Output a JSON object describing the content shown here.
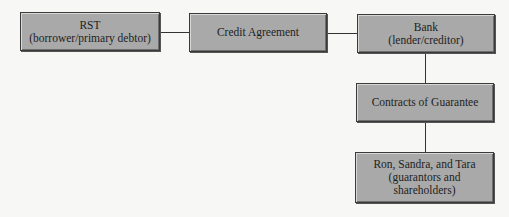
{
  "diagram": {
    "nodes": [
      {
        "id": "rst",
        "label": "RST\n(borrower/primary debtor)"
      },
      {
        "id": "credit",
        "label": "Credit Agreement"
      },
      {
        "id": "bank",
        "label": "Bank\n(lender/creditor)"
      },
      {
        "id": "contracts",
        "label": "Contracts of Guarantee"
      },
      {
        "id": "guarantors",
        "label": "Ron, Sandra, and Tara\n(guarantors and\nshareholders)"
      }
    ],
    "edges": [
      {
        "from": "rst",
        "to": "credit"
      },
      {
        "from": "credit",
        "to": "bank"
      },
      {
        "from": "bank",
        "to": "contracts"
      },
      {
        "from": "contracts",
        "to": "guarantors"
      }
    ],
    "colors": {
      "box_fill": "#a9a9a9",
      "box_border": "#3a3a3a",
      "line": "#333333",
      "background": "#f7f7f5"
    }
  }
}
